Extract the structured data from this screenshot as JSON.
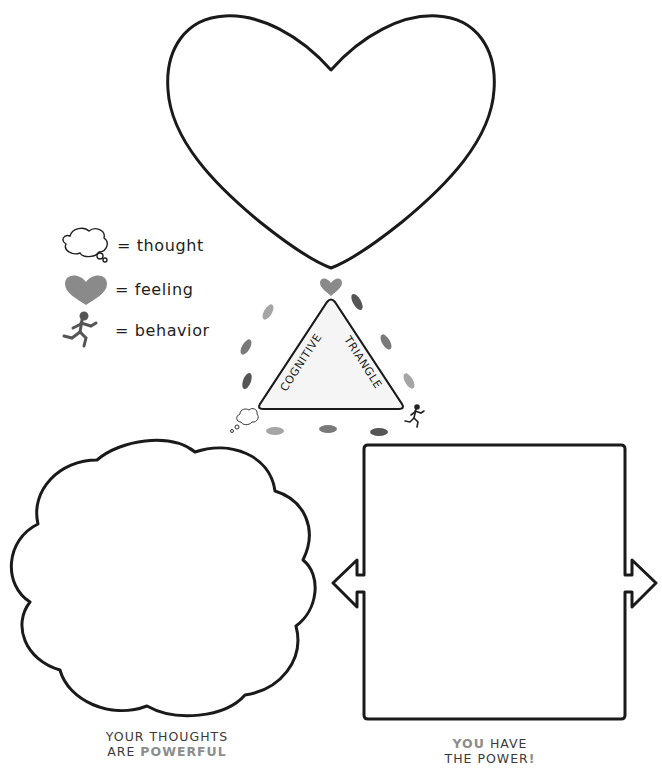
{
  "legend": {
    "items": [
      {
        "icon": "thought-cloud-icon",
        "label": "= thought"
      },
      {
        "icon": "heart-icon",
        "label": "= feeling"
      },
      {
        "icon": "runner-icon",
        "label": "= behavior"
      }
    ]
  },
  "triangle": {
    "left_label": "COGNITIVE",
    "right_label": "TRIANGLE",
    "fill": "#f5f5f5",
    "corners": {
      "top": "heart-icon",
      "bottom_left": "thought-cloud-icon",
      "bottom_right": "runner-icon"
    }
  },
  "shapes": {
    "heart": {
      "role": "feeling-drawing-area"
    },
    "cloud": {
      "role": "thought-drawing-area"
    },
    "box": {
      "role": "behavior-drawing-area"
    }
  },
  "captions": {
    "thoughts": {
      "line1": "YOUR THOUGHTS",
      "line2_prefix": "ARE ",
      "line2_highlight": "POWERFUL"
    },
    "power": {
      "line1_highlight": "YOU",
      "line1_rest": " HAVE",
      "line2": "THE POWER",
      "line2_highlight": "!"
    }
  },
  "colors": {
    "outline": "#1a1a1a",
    "icon_gray": "#8a8a8a",
    "highlight_text": "#8c8c8c",
    "footprint_dark": "#555555",
    "footprint_mid": "#7a7a7a",
    "footprint_light": "#a5a5a5"
  }
}
